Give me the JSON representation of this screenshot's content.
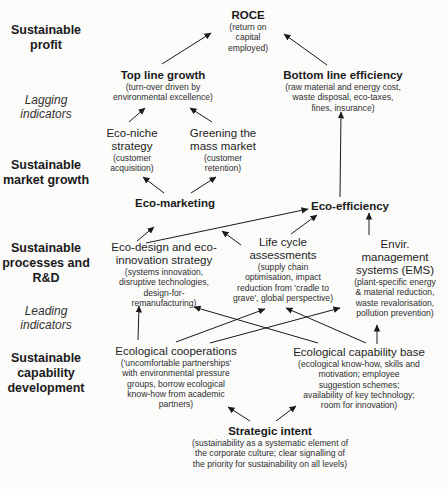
{
  "levels": [
    {
      "label": "Sustainable profit"
    },
    {
      "label": "Lagging indicators",
      "italic": true
    },
    {
      "label": "Sustainable market growth"
    },
    {
      "label": "Sustainable processes and R&D"
    },
    {
      "label": "Leading indicators",
      "italic": true
    },
    {
      "label": "Sustainable capability development"
    }
  ],
  "level_lines": {
    "l0a": "Sustainable",
    "l0b": "profit",
    "l1a": "Lagging",
    "l1b": "indicators",
    "l2a": "Sustainable",
    "l2b": "market growth",
    "l3a": "Sustainable",
    "l3b": "processes and",
    "l3c": "R&D",
    "l4a": "Leading",
    "l4b": "indicators",
    "l5a": "Sustainable",
    "l5b": "capability",
    "l5c": "development"
  },
  "nodes": {
    "roce": {
      "title": "ROCE",
      "sub": [
        "(return on",
        "capital",
        "employed)"
      ]
    },
    "top_line": {
      "title": "Top line growth",
      "sub": [
        "(turn-over driven by",
        "environmental excellence)"
      ]
    },
    "bottom_line": {
      "title": "Bottom line efficiency",
      "sub": [
        "(raw material and energy cost,",
        "waste disposal, eco-taxes,",
        "fines, insurance)"
      ]
    },
    "eco_niche": {
      "title": [
        "Eco-niche",
        "strategy"
      ],
      "sub": [
        "(customer",
        "acquisition)"
      ]
    },
    "greening": {
      "title": [
        "Greening the",
        "mass market"
      ],
      "sub": [
        "(customer",
        "retention)"
      ]
    },
    "eco_marketing": {
      "title": "Eco-marketing"
    },
    "eco_efficiency": {
      "title": "Eco-efficiency"
    },
    "eco_design": {
      "title": [
        "Eco-design and eco-",
        "innovation strategy"
      ],
      "sub": [
        "(systems innovation,",
        "disruptive technologies,",
        "design-for-",
        "remanufacturing)"
      ]
    },
    "life_cycle": {
      "title": [
        "Life cycle",
        "assessments"
      ],
      "sub": [
        "(supply chain",
        "optimisation, impact",
        "reduction from 'cradle to",
        "grave', global perspective)"
      ]
    },
    "ems": {
      "title": [
        "Envir.",
        "management",
        "systems (EMS)"
      ],
      "sub": [
        "(plant-specific energy",
        "& material reduction,",
        "waste revalorisation,",
        "pollution prevention)"
      ]
    },
    "eco_coop": {
      "title": "Ecological cooperations",
      "sub": [
        "('uncomfortable partnerships'",
        "with environmental pressure",
        "groups, borrow ecological",
        "know-how from academic",
        "partners)"
      ]
    },
    "eco_capability": {
      "title": "Ecological capability base",
      "sub": [
        "(ecological know-how, skills and",
        "motivation; employee",
        "suggestion schemes;",
        "availability of key technology;",
        "room for innovation)"
      ]
    },
    "strategic_intent": {
      "title": "Strategic intent",
      "sub": [
        "(sustainability as a systematic element of",
        "the corporate culture; clear signalling of",
        "the priority for sustainability on all levels)"
      ]
    }
  },
  "edges": [
    {
      "from": "top_line",
      "to": "roce"
    },
    {
      "from": "bottom_line",
      "to": "roce"
    },
    {
      "from": "eco_niche",
      "to": "top_line"
    },
    {
      "from": "greening",
      "to": "top_line"
    },
    {
      "from": "eco_marketing",
      "to": "eco_niche"
    },
    {
      "from": "eco_marketing",
      "to": "greening"
    },
    {
      "from": "eco_efficiency",
      "to": "bottom_line"
    },
    {
      "from": "eco_design",
      "to": "eco_marketing"
    },
    {
      "from": "eco_design",
      "to": "eco_efficiency"
    },
    {
      "from": "life_cycle",
      "to": "eco_marketing"
    },
    {
      "from": "life_cycle",
      "to": "eco_efficiency"
    },
    {
      "from": "ems",
      "to": "eco_efficiency"
    },
    {
      "from": "eco_coop",
      "to": "eco_design"
    },
    {
      "from": "eco_coop",
      "to": "life_cycle"
    },
    {
      "from": "eco_coop",
      "to": "ems"
    },
    {
      "from": "eco_capability",
      "to": "eco_design"
    },
    {
      "from": "eco_capability",
      "to": "life_cycle"
    },
    {
      "from": "eco_capability",
      "to": "ems"
    },
    {
      "from": "strategic_intent",
      "to": "eco_coop"
    },
    {
      "from": "strategic_intent",
      "to": "eco_capability"
    }
  ],
  "colors": {
    "text": "#1e1e1e",
    "arrow": "#1a1a1a",
    "background": "#fbfbfa"
  }
}
